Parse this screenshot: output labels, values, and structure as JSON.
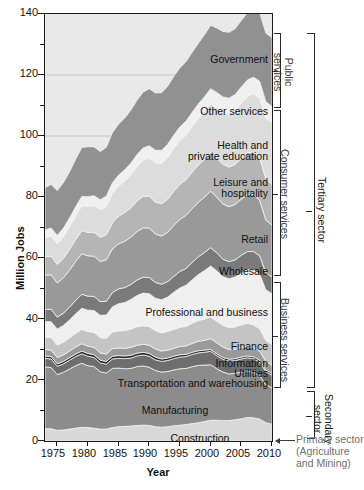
{
  "chart_data": {
    "type": "area",
    "title": "",
    "xlabel": "Year",
    "ylabel": "Million Jobs",
    "xlim": [
      1973,
      2010
    ],
    "ylim": [
      0,
      140
    ],
    "ytick_step": 20,
    "yminor_step": 10,
    "grid": true,
    "stacked": true,
    "legend": "inline-band-labels",
    "xticks": [
      "1975",
      "1980",
      "1985",
      "1990",
      "1995",
      "2000",
      "2005",
      "2010"
    ],
    "xtick_values": [
      1975,
      1980,
      1985,
      1990,
      1995,
      2000,
      2005,
      2010
    ],
    "yticks": [
      "0",
      "20",
      "40",
      "60",
      "80",
      "100",
      "120",
      "140"
    ],
    "ytick_values": [
      0,
      20,
      40,
      60,
      80,
      100,
      120,
      140
    ],
    "x": [
      1973,
      1974,
      1975,
      1976,
      1977,
      1978,
      1979,
      1980,
      1981,
      1982,
      1983,
      1984,
      1985,
      1986,
      1987,
      1988,
      1989,
      1990,
      1991,
      1992,
      1993,
      1994,
      1995,
      1996,
      1997,
      1998,
      1999,
      2000,
      2001,
      2002,
      2003,
      2004,
      2005,
      2006,
      2007,
      2008,
      2009,
      2010
    ],
    "series": [
      {
        "name": "Construction",
        "color": "#d8d8d8",
        "values": [
          4.1,
          4.0,
          3.5,
          3.6,
          3.9,
          4.2,
          4.5,
          4.4,
          4.2,
          3.9,
          3.9,
          4.4,
          4.7,
          4.8,
          4.9,
          5.1,
          5.2,
          5.1,
          4.7,
          4.5,
          4.7,
          5.0,
          5.2,
          5.4,
          5.7,
          6.0,
          6.4,
          6.8,
          6.8,
          6.7,
          6.7,
          7.0,
          7.3,
          7.7,
          7.6,
          7.2,
          6.0,
          5.5
        ]
      },
      {
        "name": "Manufacturing",
        "color": "#8c8c8c",
        "values": [
          20.2,
          20.1,
          18.3,
          18.9,
          19.7,
          20.5,
          21.0,
          20.3,
          20.2,
          18.8,
          18.4,
          19.4,
          19.2,
          18.9,
          18.9,
          19.3,
          19.4,
          19.1,
          18.4,
          18.1,
          18.1,
          18.3,
          18.5,
          18.4,
          18.7,
          18.8,
          18.5,
          18.2,
          16.9,
          15.9,
          15.3,
          15.2,
          15.3,
          15.2,
          14.9,
          14.2,
          12.5,
          11.9
        ]
      },
      {
        "name": "Transportation and warehousing",
        "color": "#6e6e6e",
        "values": [
          2.8,
          2.8,
          2.7,
          2.8,
          2.9,
          3.0,
          3.1,
          3.1,
          3.0,
          2.9,
          2.9,
          3.1,
          3.2,
          3.3,
          3.4,
          3.5,
          3.6,
          3.6,
          3.5,
          3.5,
          3.6,
          3.7,
          3.8,
          3.9,
          4.0,
          4.1,
          4.2,
          4.4,
          4.3,
          4.2,
          4.2,
          4.2,
          4.3,
          4.4,
          4.5,
          4.5,
          4.2,
          4.2
        ]
      },
      {
        "name": "Utilities",
        "color": "#2c2c2c",
        "values": [
          0.8,
          0.8,
          0.8,
          0.8,
          0.8,
          0.8,
          0.9,
          0.9,
          0.9,
          0.9,
          0.9,
          0.9,
          0.9,
          0.9,
          0.9,
          0.9,
          0.9,
          0.9,
          0.9,
          0.8,
          0.8,
          0.8,
          0.8,
          0.7,
          0.7,
          0.7,
          0.7,
          0.6,
          0.6,
          0.6,
          0.6,
          0.6,
          0.6,
          0.6,
          0.6,
          0.6,
          0.6,
          0.6
        ]
      },
      {
        "name": "Information",
        "color": "#9a9a9a",
        "values": [
          2.1,
          2.1,
          2.1,
          2.1,
          2.2,
          2.3,
          2.4,
          2.4,
          2.4,
          2.4,
          2.4,
          2.5,
          2.5,
          2.5,
          2.6,
          2.6,
          2.6,
          2.7,
          2.7,
          2.6,
          2.6,
          2.6,
          2.7,
          2.8,
          2.9,
          3.1,
          3.2,
          3.6,
          3.6,
          3.4,
          3.2,
          3.1,
          3.1,
          3.1,
          3.0,
          3.0,
          2.8,
          2.7
        ]
      },
      {
        "name": "Finance",
        "color": "#c4c4c4",
        "values": [
          4.0,
          4.1,
          4.1,
          4.2,
          4.3,
          4.5,
          4.7,
          4.8,
          4.9,
          5.0,
          5.2,
          5.4,
          5.6,
          5.8,
          6.0,
          6.1,
          6.1,
          6.1,
          6.0,
          6.0,
          6.1,
          6.2,
          6.3,
          6.4,
          6.6,
          6.8,
          7.0,
          7.1,
          7.1,
          7.1,
          7.2,
          7.3,
          7.5,
          7.6,
          7.5,
          7.3,
          6.9,
          6.7
        ]
      },
      {
        "name": "Professional and business",
        "color": "#efefef",
        "values": [
          5.1,
          5.2,
          5.2,
          5.5,
          5.9,
          6.4,
          6.9,
          7.0,
          7.2,
          7.3,
          7.6,
          8.3,
          8.9,
          9.2,
          9.7,
          10.2,
          10.7,
          10.8,
          10.6,
          10.8,
          11.3,
          12.2,
          12.9,
          13.5,
          14.3,
          15.1,
          15.9,
          16.7,
          16.5,
          16.0,
          16.0,
          16.4,
          17.0,
          17.6,
          18.0,
          17.9,
          16.6,
          16.7
        ]
      },
      {
        "name": "Wholesale",
        "color": "#7a7a7a",
        "values": [
          4.0,
          4.1,
          3.9,
          4.0,
          4.2,
          4.4,
          4.6,
          4.6,
          4.6,
          4.5,
          4.5,
          4.7,
          4.9,
          4.9,
          4.9,
          5.1,
          5.2,
          5.3,
          5.2,
          5.1,
          5.1,
          5.2,
          5.4,
          5.5,
          5.7,
          5.8,
          5.9,
          6.0,
          5.9,
          5.7,
          5.6,
          5.6,
          5.8,
          5.9,
          6.0,
          6.0,
          5.6,
          5.5
        ]
      },
      {
        "name": "Retail",
        "color": "#999999",
        "values": [
          11.3,
          11.3,
          11.2,
          11.6,
          12.1,
          12.8,
          13.3,
          13.2,
          13.2,
          13.2,
          13.6,
          14.3,
          14.8,
          15.2,
          15.5,
          15.9,
          16.2,
          16.2,
          15.9,
          15.8,
          16.1,
          16.7,
          17.1,
          17.4,
          17.6,
          17.9,
          18.2,
          18.5,
          18.3,
          18.1,
          18.0,
          18.2,
          18.4,
          18.7,
          18.7,
          18.2,
          17.2,
          17.0
        ]
      },
      {
        "name": "Leisure and hospitality",
        "color": "#b5b5b5",
        "values": [
          6.0,
          6.1,
          6.1,
          6.4,
          6.8,
          7.2,
          7.6,
          7.7,
          7.8,
          7.9,
          8.2,
          8.6,
          9.0,
          9.4,
          9.7,
          10.0,
          10.3,
          10.5,
          10.4,
          10.6,
          10.9,
          11.2,
          11.5,
          11.7,
          12.0,
          12.2,
          12.4,
          12.7,
          12.8,
          13.0,
          13.0,
          13.1,
          13.4,
          13.7,
          13.9,
          13.9,
          13.5,
          13.4
        ]
      },
      {
        "name": "Health and private education",
        "color": "#dcdcdc",
        "values": [
          6.2,
          6.5,
          6.8,
          7.1,
          7.4,
          7.7,
          8.1,
          8.5,
          8.8,
          9.0,
          9.3,
          9.6,
          9.9,
          10.3,
          10.8,
          11.3,
          11.9,
          12.4,
          12.9,
          13.3,
          13.7,
          14.0,
          14.3,
          14.6,
          14.9,
          15.2,
          15.6,
          15.9,
          16.4,
          16.9,
          17.3,
          17.6,
          18.0,
          18.5,
          19.1,
          19.6,
          19.9,
          20.2
        ]
      },
      {
        "name": "Other services",
        "color": "#f0f0f0",
        "values": [
          2.6,
          2.7,
          2.7,
          2.8,
          2.9,
          3.0,
          3.1,
          3.2,
          3.2,
          3.3,
          3.4,
          3.5,
          3.6,
          3.7,
          3.8,
          3.9,
          4.0,
          4.1,
          4.1,
          4.2,
          4.3,
          4.4,
          4.5,
          4.6,
          4.7,
          4.8,
          4.9,
          5.0,
          5.1,
          5.2,
          5.3,
          5.3,
          5.4,
          5.4,
          5.5,
          5.5,
          5.4,
          5.3
        ]
      },
      {
        "name": "Government",
        "color": "#919191",
        "values": [
          13.8,
          14.3,
          14.7,
          14.9,
          15.1,
          15.6,
          16.0,
          16.4,
          16.0,
          15.8,
          16.0,
          16.4,
          16.7,
          17.0,
          17.4,
          17.8,
          18.3,
          18.7,
          18.8,
          18.9,
          19.0,
          19.3,
          19.4,
          19.5,
          19.7,
          19.9,
          20.3,
          20.8,
          21.1,
          21.5,
          21.6,
          21.6,
          21.8,
          22.0,
          22.2,
          22.5,
          22.5,
          22.5
        ]
      }
    ],
    "band_labels": [
      {
        "name": "Government"
      },
      {
        "name": "Other services"
      },
      {
        "name": "Health and\nprivate education"
      },
      {
        "name": "Leisure and\nhospitality"
      },
      {
        "name": "Retail"
      },
      {
        "name": "Wholesale"
      },
      {
        "name": "Professional and business"
      },
      {
        "name": "Finance"
      },
      {
        "name": "Information"
      },
      {
        "name": "Utilities"
      },
      {
        "name": "Transportation and warehousing"
      },
      {
        "name": "Manufacturing"
      },
      {
        "name": "Construction"
      }
    ],
    "annotations": {
      "group_public": "Public\nservices",
      "group_consumer": "Consumer services",
      "group_business": "Business services",
      "sector_tertiary": "Tertiary sector",
      "sector_secondary": "Secondary\nsector",
      "sector_primary": "Primary sector\n(Agriculture\nand Mining)"
    }
  },
  "labels": {
    "government": "Government",
    "other_services": "Other services",
    "health_l1": "Health and",
    "health_l2": "private education",
    "leisure_l1": "Leisure and",
    "leisure_l2": "hospitality",
    "retail": "Retail",
    "wholesale": "Wholesale",
    "professional": "Professional and business",
    "finance": "Finance",
    "information": "Information",
    "utilities": "Utilities",
    "transportation": "Transportation and warehousing",
    "manufacturing": "Manufacturing",
    "construction": "Construction"
  },
  "groups": {
    "public_l1": "Public",
    "public_l2": "services",
    "consumer": "Consumer services",
    "business": "Business services",
    "tertiary": "Tertiary sector",
    "secondary_l1": "Secondary",
    "secondary_l2": "sector",
    "primary_l1": "Primary sector",
    "primary_l2": "(Agriculture",
    "primary_l3": "and Mining)"
  },
  "axes": {
    "x_title": "Year",
    "y_title": "Million Jobs",
    "y0": "0",
    "y20": "20",
    "y40": "40",
    "y60": "60",
    "y80": "80",
    "y100": "100",
    "y120": "120",
    "y140": "140",
    "x1975": "1975",
    "x1980": "1980",
    "x1985": "1985",
    "x1990": "1990",
    "x1995": "1995",
    "x2000": "2000",
    "x2005": "2005",
    "x2010": "2010"
  }
}
